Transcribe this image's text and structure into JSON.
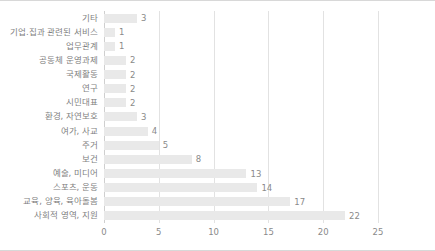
{
  "chart_data": {
    "type": "bar",
    "orientation": "horizontal",
    "title": "",
    "xlabel": "",
    "ylabel": "",
    "xlim": [
      0,
      25
    ],
    "xticks": [
      0,
      5,
      10,
      15,
      20,
      25
    ],
    "grid": "vertical",
    "legend": "none",
    "bar_color": "#e9e9e9",
    "label_color": "#7f7f7f",
    "categories": [
      "기타",
      "기업.집과 관련된 서비스",
      "업무관계",
      "공동체 운영과제",
      "국제활동",
      "연구",
      "시민대표",
      "환경, 자연보호",
      "여가, 사교",
      "주거",
      "보건",
      "예술, 미디어",
      "스포츠, 운동",
      "교육, 양육, 육아돌봄",
      "사회적 영역, 지원"
    ],
    "values": [
      3,
      1,
      1,
      2,
      2,
      2,
      2,
      3,
      4,
      5,
      8,
      13,
      14,
      17,
      22
    ],
    "value_labels": [
      "3",
      "1",
      "1",
      "2",
      "2",
      "2",
      "2",
      "3",
      "4",
      "5",
      "8",
      "13",
      "14",
      "17",
      "22"
    ]
  }
}
